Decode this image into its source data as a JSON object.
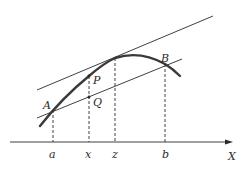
{
  "diagram": {
    "title": "",
    "colors": {
      "ink": "#2a2a2a",
      "curve": "#3a3a3a",
      "background": "#ffffff"
    },
    "axis": {
      "label": "X",
      "ticks": [
        "a",
        "x",
        "z",
        "b"
      ]
    },
    "points": {
      "A": "A",
      "B": "B",
      "P": "P",
      "Q": "Q"
    },
    "tick_labels": {
      "a": "a",
      "x": "x",
      "z": "z",
      "b": "b"
    },
    "elements": [
      "concave curve from A through P, peak near z, to B",
      "secant line through A and B",
      "tangent line at z parallel to secant",
      "dashed verticals from A, P, tangent point, and B down to the axis"
    ]
  }
}
